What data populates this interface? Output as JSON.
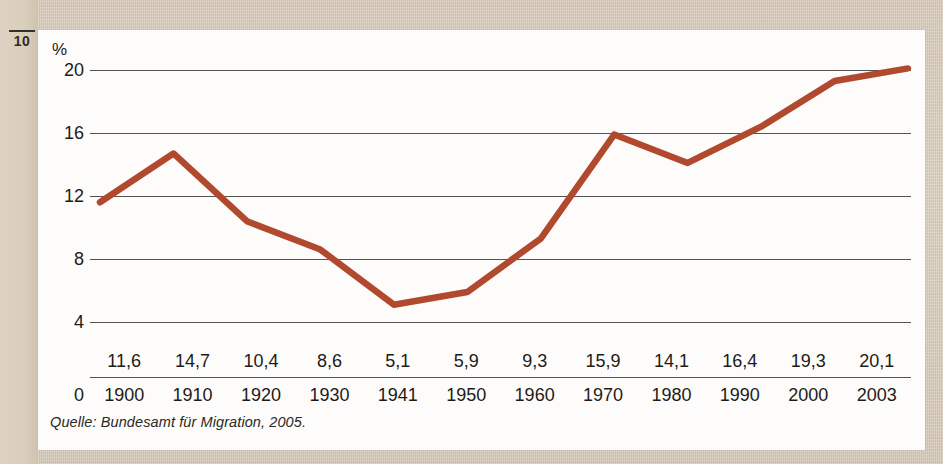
{
  "page": {
    "folio": "10",
    "background_color": "#d8ccba",
    "card_color": "#fdfcfa"
  },
  "figure": {
    "axis_unit_label": "%",
    "zero_label": "0",
    "source_note": "Quelle: Bundesamt für Migration, 2005.",
    "line_color": "#b1492f",
    "grid_color": "#55534f",
    "text_color": "#1d1b19"
  },
  "chart_data": {
    "type": "line",
    "title": "",
    "subtitle": "",
    "xlabel": "",
    "ylabel": "%",
    "categories": [
      "1900",
      "1910",
      "1920",
      "1930",
      "1941",
      "1950",
      "1960",
      "1970",
      "1980",
      "1990",
      "2000",
      "2003"
    ],
    "values": [
      11.6,
      14.7,
      10.4,
      8.6,
      5.1,
      5.9,
      9.3,
      15.9,
      14.1,
      16.4,
      19.3,
      20.1
    ],
    "value_labels": [
      "11,6",
      "14,7",
      "10,4",
      "8,6",
      "5,1",
      "5,9",
      "9,3",
      "15,9",
      "14,1",
      "16,4",
      "19,3",
      "20,1"
    ],
    "ylim": [
      0,
      20
    ],
    "yticks": [
      20,
      16,
      12,
      8,
      4,
      0
    ],
    "ytick_labels": [
      "20",
      "16",
      "12",
      "8",
      "4",
      "0"
    ],
    "grid": true,
    "grid_axis": "y",
    "legend": false,
    "annotations": [
      "Quelle: Bundesamt für Migration, 2005."
    ],
    "series": [
      {
        "name": "Ausländeranteil",
        "values": [
          11.6,
          14.7,
          10.4,
          8.6,
          5.1,
          5.9,
          9.3,
          15.9,
          14.1,
          16.4,
          19.3,
          20.1
        ]
      }
    ]
  }
}
